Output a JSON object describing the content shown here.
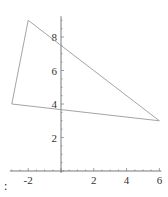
{
  "chart_data": {
    "type": "line",
    "subtype": "polygon",
    "title": "",
    "xlabel": "",
    "ylabel": "",
    "xlim": [
      -3,
      6
    ],
    "ylim": [
      0,
      9
    ],
    "grid": false,
    "legend": null,
    "x_ticks": [
      -2,
      2,
      4,
      6
    ],
    "y_ticks": [
      2,
      4,
      6,
      8
    ],
    "series": [
      {
        "name": "triangle",
        "closed": true,
        "points": [
          {
            "x": -2,
            "y": 9
          },
          {
            "x": 6,
            "y": 3
          },
          {
            "x": -3,
            "y": 4
          }
        ],
        "color": "#9a9a9a"
      }
    ],
    "axis_color": "#7a7a7a"
  },
  "prompt_suffix": ":"
}
